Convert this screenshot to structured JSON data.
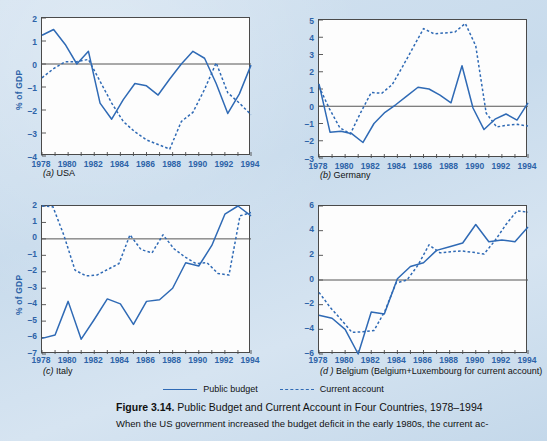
{
  "figure": {
    "number_label": "Figure 3.14.",
    "title": "Public Budget and Current Account in Four Countries, 1978–1994",
    "body_text": "When the US government increased the budget deficit in the early 1980s, the current ac-"
  },
  "legend": {
    "position": "bottom-center",
    "items": [
      {
        "label": "Public budget",
        "style": "solid",
        "color": "#2f6ab5",
        "icon": "solid-line-icon"
      },
      {
        "label": "Current account",
        "style": "dotted",
        "color": "#2f6ab5",
        "icon": "dashed-line-icon"
      }
    ]
  },
  "axis_common": {
    "ylabel": "% of GDP",
    "x": [
      1978,
      1979,
      1980,
      1981,
      1982,
      1983,
      1984,
      1985,
      1986,
      1987,
      1988,
      1989,
      1990,
      1991,
      1992,
      1993,
      1994
    ],
    "xticklabels": [
      "1978",
      "1980",
      "1982",
      "1984",
      "1986",
      "1988",
      "1990",
      "1992",
      "1994"
    ],
    "xlim": [
      1978,
      1994
    ],
    "grid": false
  },
  "chart_data": [
    {
      "id": "usa",
      "type": "line",
      "panel_letter": "(a)",
      "panel_name": "USA",
      "title": "(a) USA",
      "xlabel": "",
      "ylabel": "% of GDP",
      "xlim": [
        1978,
        1994
      ],
      "ylim": [
        -4,
        2
      ],
      "yticks": [
        -4,
        -3,
        -2,
        -1,
        0,
        1,
        2
      ],
      "yticklabels": [
        "–4",
        "–3",
        "–2",
        "–1",
        "0",
        "1",
        "2"
      ],
      "x": [
        1978,
        1979,
        1980,
        1981,
        1982,
        1983,
        1984,
        1985,
        1986,
        1987,
        1988,
        1989,
        1990,
        1991,
        1992,
        1993,
        1994
      ],
      "series": [
        {
          "name": "Public budget",
          "style": "solid",
          "color": "#2f6ab5",
          "values": [
            1.25,
            1.5,
            0.85,
            0.0,
            0.55,
            -1.7,
            -2.4,
            -1.55,
            -0.85,
            -0.95,
            -1.35,
            -0.65,
            0.0,
            0.55,
            0.25,
            -0.85,
            -2.15,
            -1.3,
            -0.05
          ]
        },
        {
          "name": "Current account",
          "style": "dotted",
          "color": "#2f6ab5",
          "values": [
            -0.6,
            -0.2,
            0.1,
            0.1,
            0.2,
            -0.75,
            -1.7,
            -2.5,
            -2.95,
            -3.3,
            -3.5,
            -3.7,
            -2.5,
            -2.1,
            -1.1,
            0.05,
            -1.25,
            -1.7,
            -2.2
          ]
        }
      ]
    },
    {
      "id": "germany",
      "type": "line",
      "panel_letter": "(b)",
      "panel_name": "Germany",
      "title": "(b) Germany",
      "xlabel": "",
      "ylabel": "",
      "xlim": [
        1978,
        1994
      ],
      "ylim": [
        -3,
        5
      ],
      "yticks": [
        -3,
        -2,
        -1,
        0,
        1,
        2,
        3,
        4,
        5
      ],
      "yticklabels": [
        "–3",
        "–2",
        "–1",
        "0",
        "1",
        "2",
        "3",
        "4",
        "5"
      ],
      "x": [
        1978,
        1979,
        1980,
        1981,
        1982,
        1983,
        1984,
        1985,
        1986,
        1987,
        1988,
        1989,
        1990,
        1991,
        1992,
        1993,
        1994
      ],
      "series": [
        {
          "name": "Public budget",
          "style": "solid",
          "color": "#2f6ab5",
          "values": [
            1.3,
            -1.5,
            -1.45,
            -1.6,
            -2.1,
            -1.0,
            -0.35,
            0.1,
            0.6,
            1.1,
            1.0,
            0.65,
            0.2,
            2.35,
            -0.1,
            -1.35,
            -0.75,
            -0.45,
            -0.8,
            0.2
          ]
        },
        {
          "name": "Current account",
          "style": "dotted",
          "color": "#2f6ab5",
          "values": [
            1.15,
            -0.15,
            -1.25,
            -1.6,
            -0.35,
            0.8,
            0.75,
            1.25,
            2.3,
            3.4,
            4.5,
            4.2,
            4.25,
            4.3,
            4.8,
            3.5,
            -0.4,
            -1.2,
            -1.1,
            -1.05,
            -1.15
          ]
        }
      ]
    },
    {
      "id": "italy",
      "type": "line",
      "panel_letter": "(c)",
      "panel_name": "Italy",
      "title": "(c) Italy",
      "xlabel": "",
      "ylabel": "% of GDP",
      "xlim": [
        1978,
        1994
      ],
      "ylim": [
        -7,
        2
      ],
      "yticks": [
        -7,
        -6,
        -5,
        -4,
        -3,
        -2,
        -1,
        0,
        1,
        2
      ],
      "yticklabels": [
        "–7",
        "–6",
        "–5",
        "–4",
        "–3",
        "–2",
        "–1",
        "0",
        "1",
        "2"
      ],
      "x": [
        1978,
        1979,
        1980,
        1981,
        1982,
        1983,
        1984,
        1985,
        1986,
        1987,
        1988,
        1989,
        1990,
        1991,
        1992,
        1993,
        1994
      ],
      "series": [
        {
          "name": "Public budget",
          "style": "solid",
          "color": "#2f6ab5",
          "values": [
            -6.05,
            -5.85,
            -3.8,
            -6.1,
            -4.9,
            -3.65,
            -3.95,
            -5.2,
            -3.8,
            -3.7,
            -3.0,
            -1.45,
            -1.65,
            -0.4,
            1.5,
            2.0,
            1.4
          ]
        },
        {
          "name": "Current account",
          "style": "dotted",
          "color": "#2f6ab5",
          "values": [
            2.0,
            1.95,
            0.2,
            -1.9,
            -2.25,
            -2.2,
            -1.85,
            -1.5,
            0.25,
            -0.65,
            -0.85,
            0.25,
            -0.6,
            -1.1,
            -1.5,
            -1.45,
            -2.1,
            -2.2,
            1.4,
            1.6
          ]
        }
      ]
    },
    {
      "id": "belgium",
      "type": "line",
      "panel_letter": "(d)",
      "panel_name": "Belgium (Belgium+Luxembourg for current account)",
      "title": "(d) Belgium (Belgium+Luxembourg for current account)",
      "xlabel": "",
      "ylabel": "",
      "xlim": [
        1978,
        1994
      ],
      "ylim": [
        -6,
        6
      ],
      "yticks": [
        -6,
        -4,
        -2,
        0,
        2,
        4,
        6
      ],
      "yticklabels": [
        "–6",
        "–4",
        "–2",
        "0",
        "2",
        "4",
        "6"
      ],
      "x": [
        1978,
        1979,
        1980,
        1981,
        1982,
        1983,
        1984,
        1985,
        1986,
        1987,
        1988,
        1989,
        1990,
        1991,
        1992,
        1993,
        1994
      ],
      "series": [
        {
          "name": "Public budget",
          "style": "solid",
          "color": "#2f6ab5",
          "values": [
            -2.85,
            -3.1,
            -4.0,
            -6.0,
            -2.6,
            -2.75,
            0.1,
            1.1,
            1.4,
            2.4,
            2.7,
            3.0,
            4.5,
            3.1,
            3.25,
            3.1,
            4.3
          ]
        },
        {
          "name": "Current account",
          "style": "dotted",
          "color": "#2f6ab5",
          "values": [
            -1.0,
            -2.2,
            -3.2,
            -4.25,
            -4.2,
            -4.1,
            -2.5,
            -0.25,
            0.0,
            1.2,
            2.85,
            2.2,
            2.3,
            2.35,
            2.25,
            2.1,
            3.2,
            4.5,
            5.6,
            5.5
          ]
        }
      ]
    }
  ]
}
